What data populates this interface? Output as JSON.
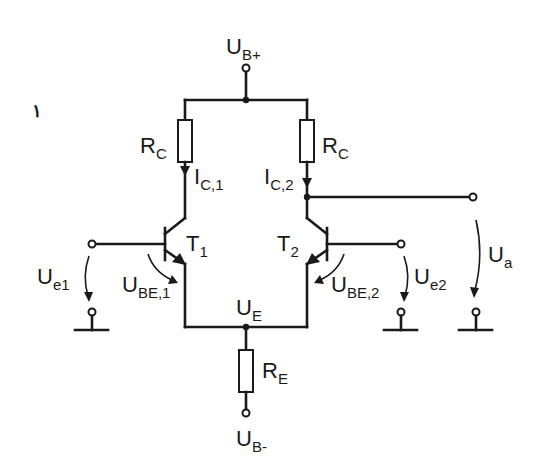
{
  "diagram": {
    "type": "circuit-schematic",
    "labels": {
      "supply_pos": {
        "main": "U",
        "sub": "B+"
      },
      "supply_neg": {
        "main": "U",
        "sub": "B-"
      },
      "rc_left": {
        "main": "R",
        "sub": "C"
      },
      "rc_right": {
        "main": "R",
        "sub": "C"
      },
      "ic1": {
        "main": "I",
        "sub": "C,1"
      },
      "ic2": {
        "main": "I",
        "sub": "C,2"
      },
      "t1": {
        "main": "T",
        "sub": "1"
      },
      "t2": {
        "main": "T",
        "sub": "2"
      },
      "ube1": {
        "main": "U",
        "sub": "BE,1"
      },
      "ube2": {
        "main": "U",
        "sub": "BE,2"
      },
      "ue": {
        "main": "U",
        "sub": "E"
      },
      "re": {
        "main": "R",
        "sub": "E"
      },
      "ue1": {
        "main": "U",
        "sub": "e1"
      },
      "ue2": {
        "main": "U",
        "sub": "e2"
      },
      "ua": {
        "main": "U",
        "sub": "a"
      }
    },
    "stray_mark": "١"
  }
}
